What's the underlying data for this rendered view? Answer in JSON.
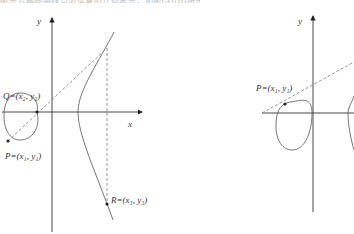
{
  "caption": {
    "text": "图示为椭圆曲线点加运算的几何表示，如图(a)(b)所示。"
  },
  "panels": [
    {
      "id": "left",
      "axes": {
        "x_label": "x",
        "y_label": "y"
      },
      "points": {
        "Q": {
          "name": "Q",
          "coords": "(x₂, y₂)",
          "label": "Q=(x₂, y₂)"
        },
        "P": {
          "name": "P",
          "coords": "(x₁, y₁)",
          "label": "P=(x₁, y₁)"
        },
        "R": {
          "name": "R",
          "coords": "(x₃, y₃)",
          "label": "R=(x₃, y₃)"
        }
      }
    },
    {
      "id": "right",
      "axes": {
        "y_label": "y"
      },
      "points": {
        "P": {
          "name": "P",
          "coords": "(x₁, y₁)",
          "label": "P=(x₁, y₁)"
        }
      }
    }
  ],
  "colors": {
    "axis": "#222222",
    "curve": "#555555",
    "dashed": "#777777",
    "point": "#222222"
  }
}
